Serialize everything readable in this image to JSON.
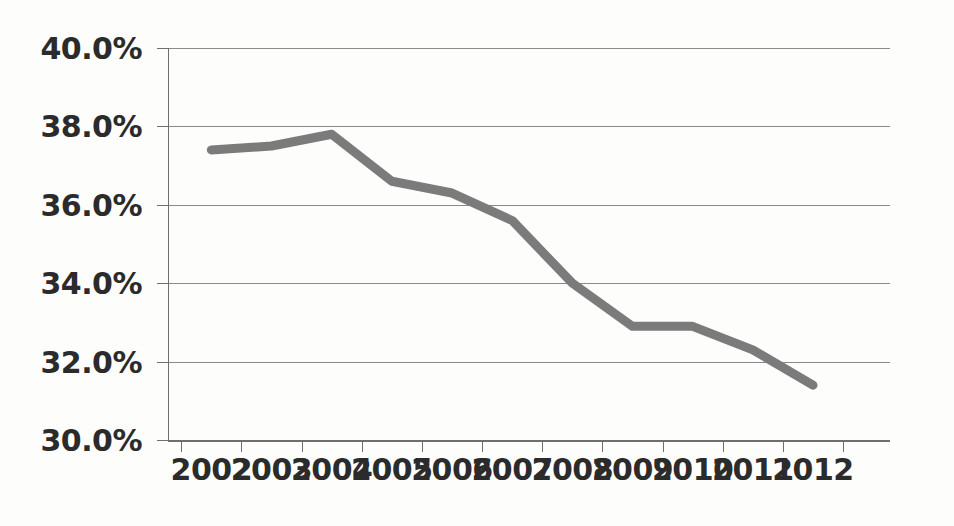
{
  "chart_data": {
    "type": "line",
    "title": "",
    "subtitle": "",
    "xlabel": "",
    "ylabel": "",
    "categories": [
      "2002",
      "2003",
      "2004",
      "2005",
      "2006",
      "2007",
      "2008",
      "2009",
      "2010",
      "2011",
      "2012"
    ],
    "values": [
      37.4,
      37.5,
      37.8,
      36.6,
      36.3,
      35.6,
      34.0,
      32.9,
      32.9,
      32.3,
      31.4
    ],
    "series": [
      {
        "name": "",
        "color": "#7b7b7b",
        "values": [
          37.4,
          37.5,
          37.8,
          36.6,
          36.3,
          35.6,
          34.0,
          32.9,
          32.9,
          32.3,
          31.4
        ]
      }
    ],
    "ylim": [
      30.0,
      40.0
    ],
    "ytick_values": [
      40.0,
      38.0,
      36.0,
      34.0,
      32.0,
      30.0
    ],
    "ytick_labels": [
      "40.0%",
      "38.0%",
      "36.0%",
      "34.0%",
      "32.0%",
      "30.0%"
    ],
    "xtick_labels": [
      "2002",
      "2003",
      "2004",
      "2005",
      "2006",
      "2007",
      "2008",
      "2009",
      "2010",
      "2011",
      "2012"
    ],
    "grid": true,
    "grid_axis": "y",
    "legend": false,
    "legend_position": "none",
    "value_format": "percent",
    "line_width_px": 9,
    "colors": {
      "line": "#7b7b7b",
      "gridline": "#8a8a8a",
      "axis": "#6f6f6f",
      "text": "#2b2b2b",
      "background": "#fdfdfc"
    }
  }
}
